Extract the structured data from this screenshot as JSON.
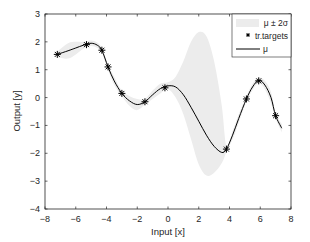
{
  "chart_data": {
    "type": "line",
    "title": "",
    "xlabel": "Input [x]",
    "ylabel": "Output [y]",
    "xlim": [
      -8,
      8
    ],
    "ylim": [
      -4,
      3
    ],
    "xticks": [
      -8,
      -6,
      -4,
      -2,
      0,
      2,
      4,
      6,
      8
    ],
    "yticks": [
      -4,
      -3,
      -2,
      -1,
      0,
      1,
      2,
      3
    ],
    "xtick_labels": [
      "−8",
      "−6",
      "−4",
      "−2",
      "0",
      "2",
      "4",
      "6",
      "8"
    ],
    "ytick_labels": [
      "−4",
      "−3",
      "−2",
      "−1",
      "0",
      "1",
      "2",
      "3"
    ],
    "grid": false,
    "legend_position": "upper right",
    "legend": [
      {
        "label": "μ ± 2σ",
        "kind": "band"
      },
      {
        "label": "tr.targets",
        "kind": "marker"
      },
      {
        "label": "μ",
        "kind": "line"
      }
    ],
    "series": [
      {
        "name": "tr.targets",
        "kind": "scatter",
        "marker": "asterisk",
        "x": [
          -7.2,
          -5.3,
          -4.3,
          -3.9,
          -3.0,
          -1.5,
          -0.2,
          3.8,
          5.1,
          5.9,
          7.0
        ],
        "y": [
          1.55,
          1.9,
          1.7,
          1.1,
          0.15,
          -0.15,
          0.35,
          -1.85,
          -0.05,
          0.6,
          -0.65
        ]
      },
      {
        "name": "μ",
        "kind": "line",
        "x": [
          -7.2,
          -6.5,
          -6.0,
          -5.5,
          -5.0,
          -4.6,
          -4.3,
          -3.9,
          -3.5,
          -3.0,
          -2.5,
          -2.0,
          -1.5,
          -1.0,
          -0.5,
          0.0,
          0.5,
          1.0,
          1.5,
          2.0,
          2.5,
          3.0,
          3.5,
          3.8,
          4.2,
          4.6,
          5.1,
          5.5,
          5.9,
          6.3,
          6.7,
          7.0,
          7.4
        ],
        "y": [
          1.55,
          1.68,
          1.78,
          1.88,
          1.95,
          1.88,
          1.7,
          1.1,
          0.6,
          0.15,
          -0.12,
          -0.25,
          -0.15,
          0.1,
          0.32,
          0.42,
          0.38,
          0.1,
          -0.35,
          -0.85,
          -1.35,
          -1.75,
          -1.97,
          -1.85,
          -1.35,
          -0.75,
          -0.05,
          0.38,
          0.62,
          0.45,
          0.0,
          -0.65,
          -1.1
        ]
      },
      {
        "name": "μ ± 2σ",
        "kind": "band",
        "x": [
          -7.2,
          -6.5,
          -6.0,
          -5.5,
          -5.0,
          -4.6,
          -4.3,
          -3.9,
          -3.5,
          -3.0,
          -2.5,
          -2.0,
          -1.5,
          -1.0,
          -0.5,
          0.0,
          0.5,
          1.0,
          1.5,
          2.0,
          2.5,
          3.0,
          3.5,
          3.8,
          4.2,
          4.6,
          5.1,
          5.5,
          5.9,
          6.3,
          6.7,
          7.0,
          7.4
        ],
        "upper": [
          1.65,
          1.95,
          2.0,
          2.0,
          2.05,
          1.98,
          1.78,
          1.2,
          0.75,
          0.25,
          0.05,
          -0.05,
          -0.05,
          0.25,
          0.5,
          0.55,
          0.75,
          1.3,
          2.0,
          2.35,
          2.2,
          1.3,
          -0.3,
          -1.75,
          -1.2,
          -0.6,
          0.05,
          0.5,
          0.72,
          0.6,
          0.2,
          -0.55,
          -0.95
        ],
        "lower": [
          1.45,
          1.4,
          1.55,
          1.75,
          1.85,
          1.78,
          1.62,
          1.0,
          0.45,
          0.05,
          -0.3,
          -0.45,
          -0.25,
          -0.05,
          0.15,
          0.3,
          0.0,
          -0.6,
          -1.5,
          -2.4,
          -2.8,
          -2.7,
          -2.35,
          -1.95,
          -1.5,
          -0.9,
          -0.15,
          0.26,
          0.52,
          0.3,
          -0.2,
          -0.75,
          -1.25
        ]
      }
    ],
    "colors": {
      "band": "#ececec",
      "line": "#000000",
      "marker": "#000000",
      "axes": "#262626",
      "legend_border": "#262626"
    }
  }
}
